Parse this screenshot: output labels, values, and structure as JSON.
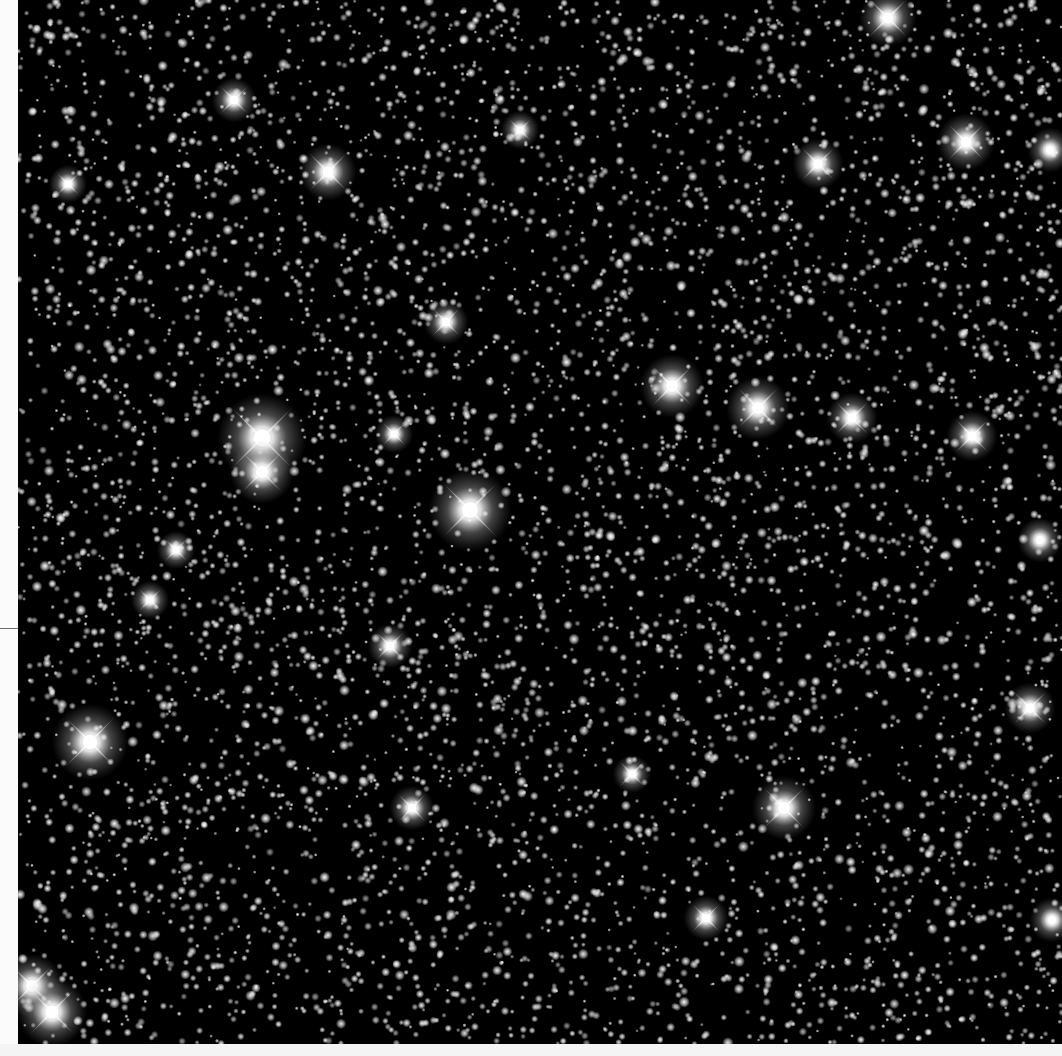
{
  "image": {
    "description": "Dense star field (globular/galactic field) with bright stars showing four-point diffraction spikes",
    "background_color": "#000000",
    "margin_color": "#fbfbfb",
    "star_color": "#ffffff",
    "width": 1062,
    "height": 1056,
    "field": {
      "x": 18,
      "y": 0,
      "w": 1044,
      "h": 1044
    },
    "margin_tick_y": 628
  },
  "render": {
    "seed": 20240611,
    "faint_star_count": 5200,
    "medium_star_count": 900,
    "min_radius": 0.8,
    "max_radius": 2.6
  },
  "bright_stars": [
    {
      "x": 262,
      "y": 438,
      "r": 14,
      "spike": 46
    },
    {
      "x": 262,
      "y": 472,
      "r": 10,
      "spike": 30
    },
    {
      "x": 470,
      "y": 510,
      "r": 13,
      "spike": 40
    },
    {
      "x": 90,
      "y": 742,
      "r": 12,
      "spike": 36
    },
    {
      "x": 672,
      "y": 386,
      "r": 10,
      "spike": 30
    },
    {
      "x": 758,
      "y": 408,
      "r": 10,
      "spike": 30
    },
    {
      "x": 328,
      "y": 172,
      "r": 9,
      "spike": 28
    },
    {
      "x": 888,
      "y": 18,
      "r": 9,
      "spike": 28
    },
    {
      "x": 966,
      "y": 142,
      "r": 9,
      "spike": 26
    },
    {
      "x": 818,
      "y": 164,
      "r": 8,
      "spike": 24
    },
    {
      "x": 852,
      "y": 418,
      "r": 8,
      "spike": 24
    },
    {
      "x": 972,
      "y": 436,
      "r": 8,
      "spike": 24
    },
    {
      "x": 784,
      "y": 808,
      "r": 10,
      "spike": 30
    },
    {
      "x": 1030,
      "y": 708,
      "r": 8,
      "spike": 24
    },
    {
      "x": 32,
      "y": 986,
      "r": 10,
      "spike": 30
    },
    {
      "x": 52,
      "y": 1012,
      "r": 11,
      "spike": 32
    },
    {
      "x": 234,
      "y": 100,
      "r": 7,
      "spike": 20
    },
    {
      "x": 446,
      "y": 322,
      "r": 7,
      "spike": 20
    },
    {
      "x": 394,
      "y": 434,
      "r": 6,
      "spike": 16
    },
    {
      "x": 632,
      "y": 774,
      "r": 6,
      "spike": 18
    },
    {
      "x": 706,
      "y": 918,
      "r": 7,
      "spike": 20
    },
    {
      "x": 176,
      "y": 550,
      "r": 6,
      "spike": 16
    },
    {
      "x": 390,
      "y": 646,
      "r": 7,
      "spike": 20
    },
    {
      "x": 412,
      "y": 808,
      "r": 7,
      "spike": 20
    },
    {
      "x": 150,
      "y": 600,
      "r": 6,
      "spike": 16
    },
    {
      "x": 68,
      "y": 184,
      "r": 6,
      "spike": 16
    },
    {
      "x": 520,
      "y": 130,
      "r": 6,
      "spike": 16
    },
    {
      "x": 1040,
      "y": 540,
      "r": 7,
      "spike": 0
    },
    {
      "x": 1050,
      "y": 150,
      "r": 7,
      "spike": 0
    },
    {
      "x": 1052,
      "y": 920,
      "r": 7,
      "spike": 0
    }
  ]
}
